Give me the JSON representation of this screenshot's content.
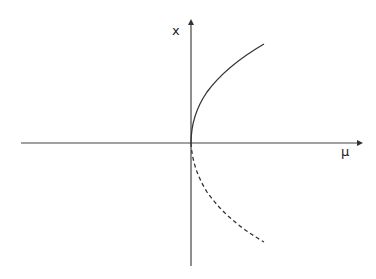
{
  "diagram": {
    "type": "bifurcation-diagram",
    "axes": {
      "horizontal": {
        "label": "μ"
      },
      "vertical": {
        "label": "x"
      }
    },
    "branches": [
      {
        "name": "upper-branch",
        "style": "solid",
        "stability": "stable"
      },
      {
        "name": "lower-branch",
        "style": "dashed",
        "stability": "unstable"
      }
    ],
    "colors": {
      "axis": "#333333",
      "curve": "#333333",
      "background": "#ffffff"
    }
  }
}
